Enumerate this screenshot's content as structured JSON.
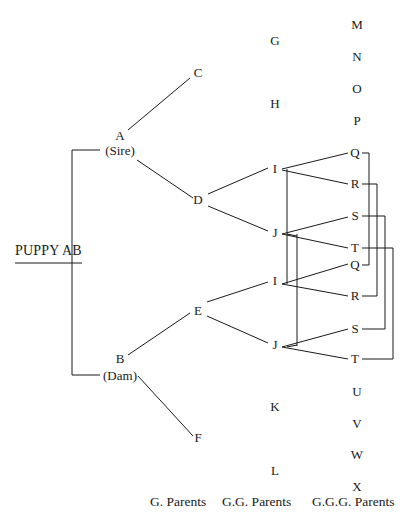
{
  "subject": {
    "label": "PUPPY AB"
  },
  "parents": {
    "sire": {
      "name": "A",
      "role": "(Sire)"
    },
    "dam": {
      "name": "B",
      "role": "(Dam)"
    }
  },
  "grandparents": {
    "c": "C",
    "d": "D",
    "e": "E",
    "f": "F"
  },
  "great_grandparents": {
    "g": "G",
    "h": "H",
    "i1": "I",
    "j1": "J",
    "i2": "I",
    "j2": "J",
    "k": "K",
    "l": "L"
  },
  "great_great_grandparents": {
    "m": "M",
    "n": "N",
    "o": "O",
    "p": "P",
    "q1": "Q",
    "r1": "R",
    "s1": "S",
    "t1": "T",
    "q2": "Q",
    "r2": "R",
    "s2": "S",
    "t2": "T",
    "u": "U",
    "v": "V",
    "w": "W",
    "x": "X"
  },
  "column_labels": {
    "g_parents": "G. Parents",
    "gg_parents": "G.G. Parents",
    "ggg_parents": "G.G.G. Parents"
  },
  "colors": {
    "line": "#1a1a1a",
    "text": "#1a1a1a",
    "background": "#ffffff"
  }
}
